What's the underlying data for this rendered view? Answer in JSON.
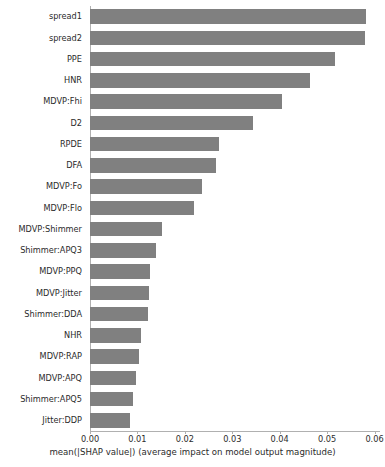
{
  "chart_data": {
    "type": "bar",
    "orientation": "horizontal",
    "title": "",
    "xlabel": "mean(|SHAP value|) (average impact on model output magnitude)",
    "ylabel": "",
    "xlim": [
      0.0,
      0.0601
    ],
    "grid": false,
    "legend": null,
    "bar_color": "#808080",
    "xticks": [
      "0.00",
      "0.01",
      "0.02",
      "0.03",
      "0.04",
      "0.05",
      "0.06"
    ],
    "xtick_values": [
      0.0,
      0.01,
      0.02,
      0.03,
      0.04,
      0.05,
      0.06
    ],
    "categories": [
      "spread1",
      "spread2",
      "PPE",
      "HNR",
      "MDVP:Fhi",
      "D2",
      "RPDE",
      "DFA",
      "MDVP:Fo",
      "MDVP:Flo",
      "MDVP:Shimmer",
      "Shimmer:APQ3",
      "MDVP:PPQ",
      "MDVP:Jitter",
      "Shimmer:DDA",
      "NHR",
      "MDVP:RAP",
      "MDVP:APQ",
      "Shimmer:APQ5",
      "Jitter:DDP"
    ],
    "values": [
      0.0583,
      0.058,
      0.0516,
      0.0463,
      0.0404,
      0.0343,
      0.0273,
      0.0265,
      0.0237,
      0.022,
      0.0151,
      0.0139,
      0.0127,
      0.0124,
      0.0122,
      0.0108,
      0.0104,
      0.0098,
      0.009,
      0.0084
    ]
  },
  "axis": {
    "xlabel": "mean(|SHAP value|) (average impact on model output magnitude)"
  }
}
